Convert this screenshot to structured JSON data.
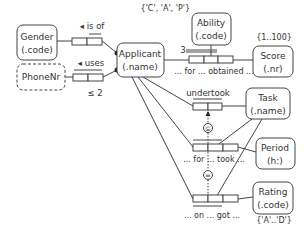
{
  "diagram": {
    "type": "ORM conceptual schema",
    "entities": [
      {
        "id": "gender",
        "name": "Gender",
        "ref": "(.code)",
        "dashed": false
      },
      {
        "id": "phonenr",
        "name": "PhoneNr",
        "ref": "",
        "dashed": true
      },
      {
        "id": "applicant",
        "name": "Applicant",
        "ref": "(.name)",
        "dashed": false
      },
      {
        "id": "ability",
        "name": "Ability",
        "ref": "(.code)",
        "dashed": false
      },
      {
        "id": "score",
        "name": "Score",
        "ref": "(.nr)",
        "dashed": false
      },
      {
        "id": "task",
        "name": "Task",
        "ref": "(.name)",
        "dashed": false
      },
      {
        "id": "period",
        "name": "Period",
        "ref": "(h:)",
        "dashed": false
      },
      {
        "id": "rating",
        "name": "Rating",
        "ref": "(.code)",
        "dashed": false
      }
    ],
    "value_constraints": {
      "ability": "{'C', 'A', 'P'}",
      "score": "{1..100}",
      "rating": "{'A'..'D'}"
    },
    "fact_types": [
      {
        "id": "is_of",
        "reading": "◂ is of"
      },
      {
        "id": "uses",
        "reading": "◂ uses",
        "frequency": "≤ 2"
      },
      {
        "id": "obtained",
        "reading": "... for ... obtained ...",
        "frequency": "3"
      },
      {
        "id": "undertook",
        "reading": "undertook"
      },
      {
        "id": "for_took",
        "reading": "... for ... took ..."
      },
      {
        "id": "on_got",
        "reading": "... on ... got ..."
      }
    ],
    "set_constraints": {
      "subset": "⊆",
      "equality": "="
    }
  }
}
